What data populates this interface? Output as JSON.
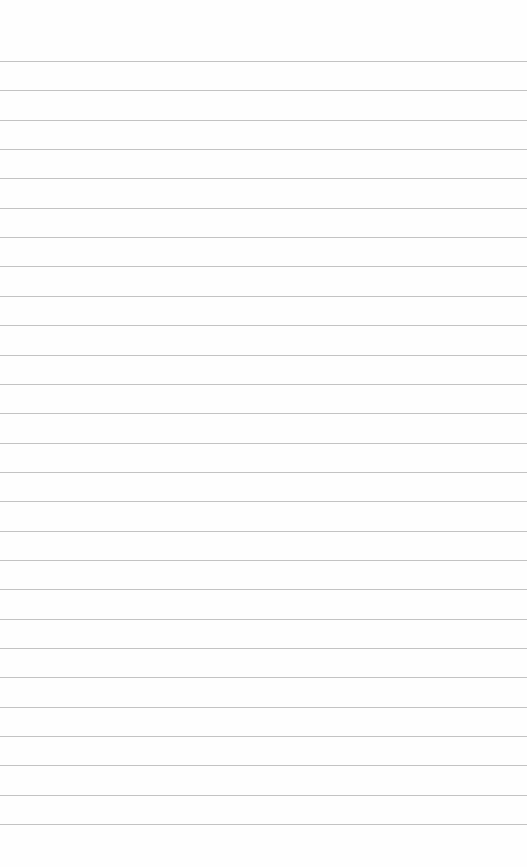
{
  "page": {
    "type": "blank ruled notepad page",
    "background_color": "#fefefe",
    "rule_color": "#b9b9b9",
    "first_rule_y": 61,
    "rule_spacing": 29.35,
    "rule_count": 27,
    "text": ""
  }
}
